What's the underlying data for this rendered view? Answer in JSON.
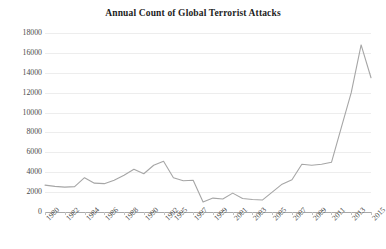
{
  "chart_data": {
    "type": "line",
    "title": "Annual Count of Global Terrorist Attacks",
    "xlabel": "",
    "ylabel": "",
    "grid": true,
    "legend": false,
    "ylim": [
      0,
      18000
    ],
    "ytick_labels": [
      "18000",
      "16000",
      "14000",
      "12000",
      "10000",
      "8000",
      "6000",
      "4000",
      "2000",
      "0"
    ],
    "ytick_values": [
      18000,
      16000,
      14000,
      12000,
      10000,
      8000,
      6000,
      4000,
      2000,
      0
    ],
    "categories": [
      "1980",
      "1981",
      "1982",
      "1983",
      "1984",
      "1985",
      "1986",
      "1987",
      "1988",
      "1989",
      "1990",
      "1991",
      "1992",
      "1995",
      "1996",
      "1997",
      "1998",
      "1999",
      "2000",
      "2001",
      "2002",
      "2003",
      "2004",
      "2005",
      "2006",
      "2007",
      "2008",
      "2009",
      "2010",
      "2011",
      "2012",
      "2013",
      "2014",
      "2015"
    ],
    "xtick_labels_shown": [
      "1980",
      "1982",
      "1984",
      "1986",
      "1988",
      "1990",
      "1992",
      "1995",
      "1997",
      "1999",
      "2001",
      "2003",
      "2005",
      "2007",
      "2009",
      "2011",
      "2013",
      "2015"
    ],
    "values": [
      2700,
      2580,
      2500,
      2550,
      3450,
      2900,
      2850,
      3200,
      3700,
      4300,
      3850,
      4700,
      5100,
      3450,
      3150,
      3200,
      1000,
      1400,
      1300,
      1900,
      1350,
      1250,
      1200,
      2000,
      2800,
      3250,
      4800,
      4700,
      4800,
      5000,
      8500,
      12000,
      16800,
      13500
    ],
    "line_color": "#a6a6a6",
    "gridline_color": "#ededed",
    "axis_color": "#a8a8a8",
    "background_color": "#ffffff"
  }
}
